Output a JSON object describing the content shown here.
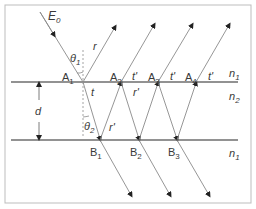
{
  "figure": {
    "type": "thin-film multiple reflection diagram",
    "colors": {
      "frame": "#bdbdbd",
      "interface": "#6e6e6e",
      "ray": "#8a8a8a",
      "arrow": "#222222",
      "text": "#3a3a3a",
      "normal": "#9a9a9a"
    },
    "labels": {
      "incident": {
        "base": "E",
        "sub": "0"
      },
      "theta1": {
        "base": "θ",
        "sub": "1"
      },
      "theta2": {
        "base": "θ",
        "sub": "2"
      },
      "r": "r",
      "t": "t",
      "t_prime": "t'",
      "r_prime": "r'",
      "d": "d",
      "n1_top": {
        "base": "n",
        "sub": "1"
      },
      "n2": {
        "base": "n",
        "sub": "2"
      },
      "n1_bottom": {
        "base": "n",
        "sub": "1"
      }
    },
    "points_top": [
      {
        "base": "A",
        "sub": "1"
      },
      {
        "base": "A",
        "sub": "2"
      },
      {
        "base": "A",
        "sub": "3"
      },
      {
        "base": "A",
        "sub": "4"
      }
    ],
    "points_bottom": [
      {
        "base": "B",
        "sub": "1"
      },
      {
        "base": "B",
        "sub": "2"
      },
      {
        "base": "B",
        "sub": "3"
      }
    ],
    "media": [
      "n1",
      "n2",
      "n1"
    ]
  }
}
